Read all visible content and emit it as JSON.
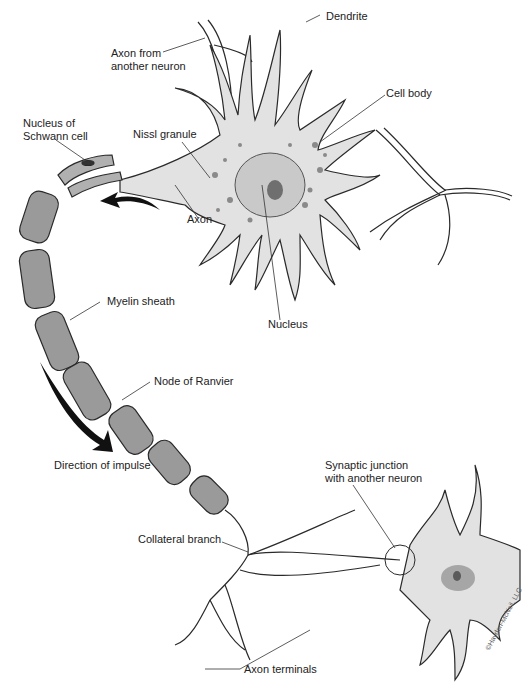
{
  "diagram": {
    "colors": {
      "cell_fill": "#e2e2e2",
      "outline": "#2a2a2a",
      "myelin": "#9a9a9a",
      "nucleus": "#b8b8b8",
      "nucleolus": "#6f6f6f",
      "arrow": "#111111"
    },
    "labels": {
      "axon_from": "Axon from\nanother neuron",
      "axon_from_1": "Axon from",
      "axon_from_2": "another neuron",
      "dendrite": "Dendrite",
      "cell_body": "Cell body",
      "schwann_1": "Nucleus of",
      "schwann_2": "Schwann cell",
      "nissl": "Nissl granule",
      "axon": "Axon",
      "nucleus": "Nucleus",
      "myelin": "Myelin sheath",
      "node": "Node of Ranvier",
      "direction": "Direction of impulse",
      "synaptic_1": "Synaptic junction",
      "synaptic_2": "with another neuron",
      "collateral": "Collateral branch",
      "terminals": "Axon terminals"
    },
    "copyright": "©Hayden-McNeil, LLC"
  }
}
